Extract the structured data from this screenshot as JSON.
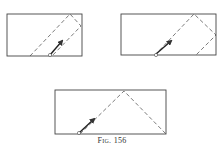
{
  "caption": "Fig. 156",
  "colors": {
    "stroke": "#444444",
    "background": "#ffffff"
  },
  "panels": [
    {
      "name": "panel-1",
      "rect": [
        7,
        14,
        75,
        42
      ],
      "dashed_path": "30,56 70,14 81,26 52,56",
      "circle": [
        50,
        55
      ],
      "arrow": [
        50,
        55,
        62,
        41
      ]
    },
    {
      "name": "panel-2",
      "rect": [
        121,
        14,
        95,
        41
      ],
      "dashed_path": "155,55 194,14 216,35 196,55",
      "circle": [
        156,
        55
      ],
      "arrow": [
        156,
        54,
        171,
        41
      ]
    },
    {
      "name": "panel-3",
      "rect": [
        55,
        90,
        111,
        44
      ],
      "dashed_path": "80,134 124,91 166,134",
      "circle": [
        79,
        133
      ],
      "arrow": [
        79,
        133,
        94,
        119
      ]
    }
  ]
}
